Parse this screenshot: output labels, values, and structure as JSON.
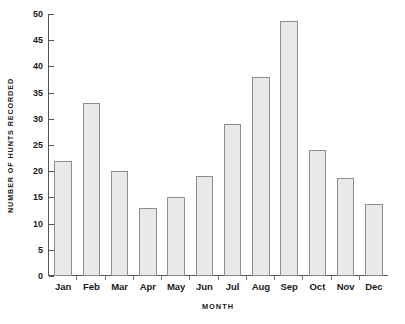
{
  "chart_data": {
    "type": "bar",
    "title": "",
    "xlabel": "MONTH",
    "ylabel": "NUMBER OF HUNTS RECORDED",
    "categories": [
      "Jan",
      "Feb",
      "Mar",
      "Apr",
      "May",
      "Jun",
      "Jul",
      "Aug",
      "Sep",
      "Oct",
      "Nov",
      "Dec"
    ],
    "values": [
      22,
      33,
      20,
      13,
      15,
      19,
      29,
      38,
      48.7,
      24,
      18.8,
      13.7
    ],
    "ylim": [
      0,
      50
    ],
    "ytick_labels": [
      "0",
      "5",
      "10",
      "15",
      "20",
      "25",
      "30",
      "35",
      "40",
      "45",
      "50"
    ],
    "ytick_values": [
      0,
      5,
      10,
      15,
      20,
      25,
      30,
      35,
      40,
      45,
      50
    ],
    "ytick_step": 5,
    "grid": false,
    "legend": false,
    "bar_fill_color": "#e9e9e9",
    "bar_border_color": "#8d8d8d",
    "axis_color": "#555555",
    "background_color": "#ffffff"
  }
}
